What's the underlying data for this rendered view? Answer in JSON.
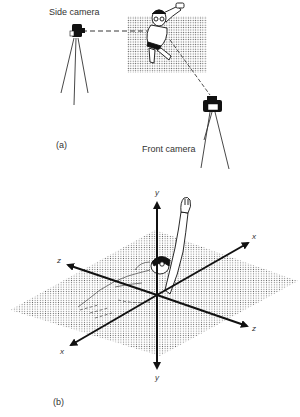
{
  "panel_a": {
    "label": "(a)",
    "side_camera_label": "Side camera",
    "front_camera_label": "Front camera"
  },
  "panel_b": {
    "label": "(b)",
    "axes": {
      "y_top": "y",
      "y_bottom": "y",
      "x_upper": "x",
      "x_lower": "x",
      "z_left": "z",
      "z_right": "z"
    }
  },
  "colors": {
    "ink": "#111111",
    "text": "#333333",
    "background": "#ffffff"
  }
}
